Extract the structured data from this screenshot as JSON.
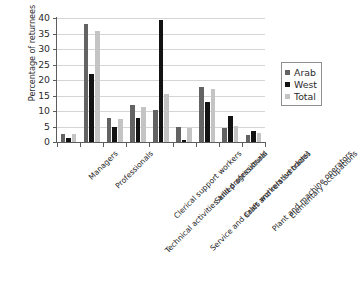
{
  "chart_data": {
    "type": "bar",
    "title": "",
    "xlabel": "",
    "ylabel": "Percentage of returnees",
    "ylim": [
      0,
      40
    ],
    "ytick_step": 5,
    "yticks": [
      0,
      5,
      10,
      15,
      20,
      25,
      30,
      35,
      40
    ],
    "grid": true,
    "legend_position": "right",
    "categories": [
      "Managers",
      "Professionals",
      "Technical activities and professionals",
      "Clerical support workers",
      "Service and sales workers (vendors)",
      "Skilled agricultural",
      "Craft and related trades",
      "Plant and machine operators",
      "Elementary occupations"
    ],
    "series": [
      {
        "name": "Arab",
        "color": "#636363",
        "values": [
          2.7,
          38.1,
          7.7,
          12.0,
          10.3,
          4.8,
          17.8,
          4.4,
          2.4
        ]
      },
      {
        "name": "West",
        "color": "#131313",
        "values": [
          1.2,
          22.1,
          4.8,
          7.8,
          39.2,
          0.8,
          13.0,
          8.5,
          3.5
        ]
      },
      {
        "name": "Total",
        "color": "#c4c4c4",
        "values": [
          2.5,
          35.7,
          7.4,
          11.4,
          15.4,
          4.6,
          17.0,
          5.2,
          2.8
        ]
      }
    ]
  },
  "legend": {
    "items": [
      {
        "label": "Arab"
      },
      {
        "label": "West"
      },
      {
        "label": "Total"
      }
    ]
  },
  "caption": ""
}
